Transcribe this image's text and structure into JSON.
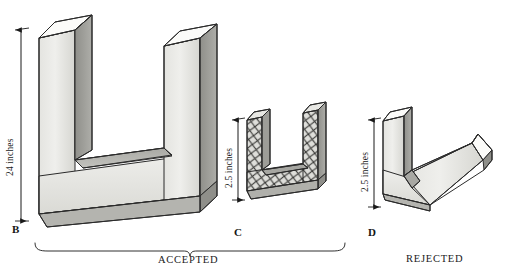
{
  "figure": {
    "background_color": "#ffffff",
    "ink_color": "#1a1a1a"
  },
  "objects": [
    {
      "id": "B",
      "label": "B",
      "shape": "u-channel-large",
      "texture": "smooth",
      "verdict": "ACCEPTED",
      "dimension": {
        "text": "24 inches",
        "value": 24,
        "unit": "inches",
        "orientation": "vertical"
      }
    },
    {
      "id": "C",
      "label": "C",
      "shape": "u-channel-small",
      "texture": "cross-hatch-mesh",
      "verdict": "ACCEPTED",
      "dimension": {
        "text": "2.5 inches",
        "value": 2.5,
        "unit": "inches",
        "orientation": "vertical"
      }
    },
    {
      "id": "D",
      "label": "D",
      "shape": "v-channel-angled",
      "texture": "smooth",
      "verdict": "REJECTED",
      "dimension": {
        "text": "2.5 inches",
        "value": 2.5,
        "unit": "inches",
        "orientation": "vertical"
      }
    }
  ],
  "verdicts": {
    "accepted_label": "ACCEPTED",
    "rejected_label": "REJECTED"
  },
  "colors": {
    "face_front_light": "#e9e9e6",
    "face_front_mid": "#dcdcd8",
    "face_top": "#fbfbf9",
    "face_side_dark": "#9a9a96",
    "face_inner": "#b8b8b3",
    "outline": "#2b2b2b"
  }
}
